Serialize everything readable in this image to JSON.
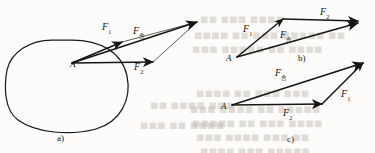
{
  "figure": {
    "caption_style": "physics-force-vector-diagram",
    "panels": [
      {
        "id": "a",
        "label": "a)",
        "label_x": 57,
        "label_y": 133,
        "origin_label": "A",
        "origin_x": 70,
        "origin_y": 60,
        "description": "Object outline with two forces applied at point A and their resultant shown by the parallelogram rule",
        "vectors": [
          {
            "name": "F1",
            "base": "F",
            "sub": "1",
            "label_x": 102,
            "label_y": 22,
            "x1": 72,
            "y1": 63,
            "x2": 122,
            "y2": 42
          },
          {
            "name": "F2",
            "base": "F",
            "sub": "2",
            "label_x": 134,
            "label_y": 62,
            "x1": 72,
            "y1": 63,
            "x2": 153,
            "y2": 62
          },
          {
            "name": "Fresultant",
            "base": "F",
            "sub": "合",
            "label_x": 133,
            "label_y": 26,
            "x1": 72,
            "y1": 63,
            "x2": 197,
            "y2": 22
          }
        ]
      },
      {
        "id": "b",
        "label": "b)",
        "label_x": 298,
        "label_y": 53,
        "origin_label": "A",
        "origin_x": 226,
        "origin_y": 54,
        "description": "Triangle rule: F1 then F2 tip-to-tail giving the resultant",
        "vectors": [
          {
            "name": "F1",
            "base": "F",
            "sub": "1",
            "label_x": 243,
            "label_y": 24,
            "x1": 237,
            "y1": 57,
            "x2": 283,
            "y2": 19
          },
          {
            "name": "F2",
            "base": "F",
            "sub": "2",
            "label_x": 320,
            "label_y": 7,
            "x1": 283,
            "y1": 19,
            "x2": 358,
            "y2": 21
          },
          {
            "name": "Fresultant",
            "base": "F",
            "sub": "合",
            "label_x": 280,
            "label_y": 30,
            "x1": 237,
            "y1": 57,
            "x2": 358,
            "y2": 23
          }
        ]
      },
      {
        "id": "c",
        "label": "c)",
        "label_x": 287,
        "label_y": 134,
        "origin_label": "A",
        "origin_x": 221,
        "origin_y": 102,
        "description": "Triangle rule with the order reversed: F2 then F1 tip-to-tail giving the same resultant",
        "vectors": [
          {
            "name": "F2",
            "base": "F",
            "sub": "2",
            "label_x": 283,
            "label_y": 108,
            "x1": 232,
            "y1": 105,
            "x2": 322,
            "y2": 104
          },
          {
            "name": "F1",
            "base": "F",
            "sub": "1",
            "label_x": 341,
            "label_y": 89,
            "x1": 322,
            "y1": 104,
            "x2": 363,
            "y2": 63
          },
          {
            "name": "Fresultant",
            "base": "F",
            "sub": "合",
            "label_x": 275,
            "label_y": 68,
            "x1": 232,
            "y1": 105,
            "x2": 363,
            "y2": 63
          }
        ]
      }
    ],
    "colors": {
      "ink": "#151515",
      "outline": "#1b1b1b",
      "background": "#fdfcfa",
      "bleedthrough": "#b9b2ab"
    },
    "bleedthrough_marks": [
      {
        "text": "■■ ■■■ ■■■■",
        "x": 200,
        "y": 14
      },
      {
        "text": "■■■■ ■■ ■■■ ■■■■■ ■■",
        "x": 194,
        "y": 30
      },
      {
        "text": "■■■ ■■■■■ ■■ ■■■■",
        "x": 192,
        "y": 44
      },
      {
        "text": "■■■■ ■■ ■■■ ■■■",
        "x": 196,
        "y": 88
      },
      {
        "text": "■■■ ■■■■ ■■ ■■■■■",
        "x": 190,
        "y": 104
      },
      {
        "text": "■■■■■ ■■ ■■■ ■■■■",
        "x": 192,
        "y": 118
      },
      {
        "text": "■■■ ■■■■ ■■■ ■■",
        "x": 196,
        "y": 132
      },
      {
        "text": "■■■■ ■■■ ■■■■■",
        "x": 200,
        "y": 146
      },
      {
        "text": "■■ ■■■■ ■■■",
        "x": 150,
        "y": 100
      },
      {
        "text": "■■■ ■■ ■■■■",
        "x": 140,
        "y": 120
      }
    ]
  }
}
